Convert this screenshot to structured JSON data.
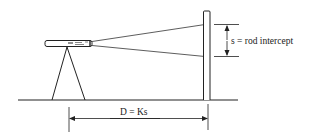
{
  "diagram": {
    "type": "stadia-measurement",
    "labels": {
      "rod_intercept": "s = rod intercept",
      "distance": "D = Ks"
    },
    "elements": {
      "instrument": "telescope on tripod",
      "rod": "leveling rod",
      "ground": "ground line",
      "sight_lines": 2
    },
    "colors": {
      "stroke": "#222222",
      "background": "#ffffff"
    }
  }
}
